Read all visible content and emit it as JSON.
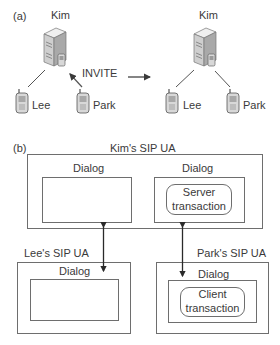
{
  "part_a": {
    "label": "(a)",
    "before": {
      "server_label": "Kim",
      "phones": [
        {
          "label": "Lee"
        },
        {
          "label": "Park"
        }
      ],
      "message": "INVITE"
    },
    "after": {
      "server_label": "Kim",
      "phones": [
        {
          "label": "Lee"
        },
        {
          "label": "Park"
        }
      ]
    }
  },
  "part_b": {
    "label": "(b)",
    "kim_ua": {
      "title": "Kim's SIP UA",
      "dialogs": [
        {
          "label": "Dialog"
        },
        {
          "label": "Dialog",
          "transaction": [
            "Server",
            "transaction"
          ]
        }
      ]
    },
    "lee_ua": {
      "title": "Lee's SIP UA",
      "dialog": {
        "label": "Dialog"
      }
    },
    "park_ua": {
      "title": "Park's SIP UA",
      "dialog": {
        "label": "Dialog",
        "transaction": [
          "Client",
          "transaction"
        ]
      }
    }
  },
  "colors": {
    "line": "#3a3a3a",
    "box_border": "#6e6e6e",
    "server_body": "#d8d8d8",
    "server_dark": "#8a8a8a"
  }
}
